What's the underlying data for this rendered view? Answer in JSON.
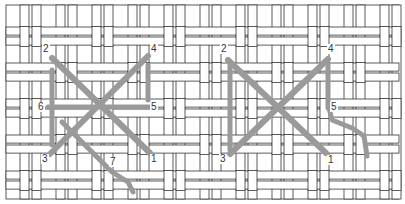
{
  "diagram": {
    "colors": {
      "thread": "#9a9a9a",
      "canvas_line": "#333333",
      "background": "#ffffff"
    },
    "canvas": {
      "x": 6,
      "y": 5,
      "width": 393,
      "height": 194
    },
    "panels": [
      {
        "id": "left",
        "labels": [
          {
            "text": "2",
            "x": 42,
            "y": 44
          },
          {
            "text": "4",
            "x": 150,
            "y": 44
          },
          {
            "text": "6",
            "x": 37,
            "y": 102
          },
          {
            "text": "5",
            "x": 150,
            "y": 102
          },
          {
            "text": "3",
            "x": 41,
            "y": 154
          },
          {
            "text": "7",
            "x": 109,
            "y": 157
          },
          {
            "text": "1",
            "x": 150,
            "y": 154
          }
        ],
        "strokes": [
          {
            "name": "underlay-left-vertical",
            "points": [
              [
                52,
                70
              ],
              [
                52,
                145
              ]
            ],
            "width": 5
          },
          {
            "name": "underlay-right-vertical",
            "points": [
              [
                148,
                65
              ],
              [
                148,
                100
              ]
            ],
            "width": 5
          },
          {
            "name": "horizontal-6-5",
            "points": [
              [
                48,
                107
              ],
              [
                150,
                107
              ]
            ],
            "width": 5
          },
          {
            "name": "diagonal-2-1",
            "points": [
              [
                52,
                58
              ],
              [
                150,
                153
              ]
            ],
            "width": 6
          },
          {
            "name": "diagonal-3-4",
            "points": [
              [
                50,
                154
              ],
              [
                148,
                56
              ]
            ],
            "width": 6
          },
          {
            "name": "tail-to-7",
            "points": [
              [
                62,
                122
              ],
              [
                90,
                150
              ],
              [
                112,
                172
              ],
              [
                128,
                182
              ],
              [
                133,
                192
              ]
            ],
            "width": 5
          }
        ]
      },
      {
        "id": "right",
        "labels": [
          {
            "text": "2",
            "x": 220,
            "y": 44
          },
          {
            "text": "4",
            "x": 327,
            "y": 44
          },
          {
            "text": "5",
            "x": 330,
            "y": 102
          },
          {
            "text": "3",
            "x": 219,
            "y": 154
          },
          {
            "text": "1",
            "x": 327,
            "y": 155
          }
        ],
        "strokes": [
          {
            "name": "underlay-left-vertical",
            "points": [
              [
                230,
                65
              ],
              [
                230,
                150
              ]
            ],
            "width": 5
          },
          {
            "name": "underlay-right-vertical",
            "points": [
              [
                328,
                65
              ],
              [
                328,
                108
              ]
            ],
            "width": 5
          },
          {
            "name": "diagonal-2-1",
            "points": [
              [
                228,
                60
              ],
              [
                326,
                153
              ]
            ],
            "width": 6
          },
          {
            "name": "diagonal-3-4",
            "points": [
              [
                230,
                154
              ],
              [
                328,
                59
              ]
            ],
            "width": 6
          },
          {
            "name": "tail-from-5",
            "points": [
              [
                329,
                108
              ],
              [
                332,
                120
              ],
              [
                352,
                128
              ],
              [
                364,
                136
              ],
              [
                367,
                156
              ]
            ],
            "width": 5
          }
        ]
      }
    ]
  }
}
